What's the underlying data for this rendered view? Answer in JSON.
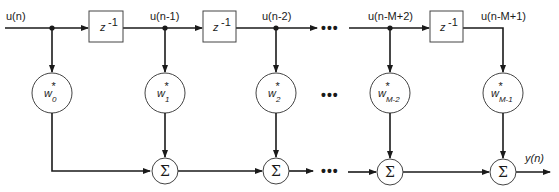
{
  "diagram": {
    "title": "",
    "type": "transversal FIR filter",
    "signals": {
      "input": "u(n)",
      "taps": [
        "u(n-1)",
        "u(n-2)",
        "u(n-M+2)",
        "u(n-M+1)"
      ],
      "output": "y(n)"
    },
    "delays": [
      {
        "label": "z",
        "exp": "-1"
      },
      {
        "label": "z",
        "exp": "-1"
      },
      {
        "label": "z",
        "exp": "-1"
      }
    ],
    "weights": [
      {
        "base": "w",
        "star": "*",
        "sub": "0"
      },
      {
        "base": "w",
        "star": "*",
        "sub": "1"
      },
      {
        "base": "w",
        "star": "*",
        "sub": "2"
      },
      {
        "base": "w",
        "star": "*",
        "sub": "M-2"
      },
      {
        "base": "w",
        "star": "*",
        "sub": "M-1"
      }
    ],
    "sum_symbol": "Σ",
    "ellipsis": "•••",
    "colors": {
      "line": "#1a1a1a",
      "outline": "#444444",
      "background": "#ffffff"
    }
  }
}
